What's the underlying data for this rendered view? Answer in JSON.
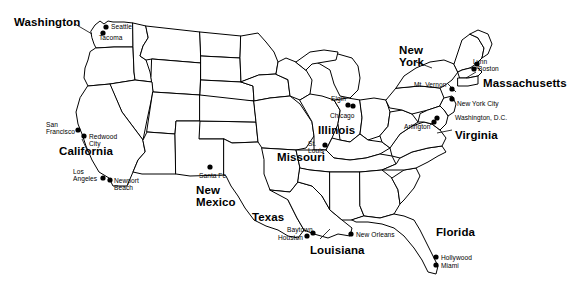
{
  "map": {
    "title": "United States map with selected states and cities",
    "stroke_color": "#000000",
    "fill_color": "#ffffff",
    "background": "#ffffff",
    "width": 581,
    "height": 296
  },
  "states": [
    {
      "name": "Washington",
      "label": "Washington",
      "x": 14,
      "y": 17,
      "lines": [
        "Washington"
      ]
    },
    {
      "name": "California",
      "label": "California",
      "x": 59,
      "y": 146,
      "lines": [
        "California"
      ]
    },
    {
      "name": "New Mexico",
      "label": "New Mexico",
      "x": 196,
      "y": 184,
      "lines": [
        "New",
        "Mexico"
      ]
    },
    {
      "name": "Texas",
      "label": "Texas",
      "x": 252,
      "y": 212,
      "lines": [
        "Texas"
      ]
    },
    {
      "name": "Louisiana",
      "label": "Louisiana",
      "x": 310,
      "y": 245,
      "lines": [
        "Louisiana"
      ]
    },
    {
      "name": "Missouri",
      "label": "Missouri",
      "x": 277,
      "y": 152,
      "lines": [
        "Missouri"
      ]
    },
    {
      "name": "Illinois",
      "label": "Illinois",
      "x": 318,
      "y": 125,
      "lines": [
        "Illinois"
      ]
    },
    {
      "name": "New York",
      "label": "New York",
      "x": 399,
      "y": 44,
      "lines": [
        "New",
        "York"
      ]
    },
    {
      "name": "Massachusetts",
      "label": "Massachusetts",
      "x": 483,
      "y": 78,
      "lines": [
        "Massachusetts"
      ]
    },
    {
      "name": "Virginia",
      "label": "Virginia",
      "x": 455,
      "y": 130,
      "lines": [
        "Virginia"
      ]
    },
    {
      "name": "Florida",
      "label": "Florida",
      "x": 436,
      "y": 227,
      "lines": [
        "Florida"
      ]
    }
  ],
  "cities": [
    {
      "name": "Seattle",
      "label": "Seattle",
      "dot_x": 106,
      "dot_y": 27,
      "label_x": 111,
      "label_y": 23,
      "align": "left",
      "lines": [
        "Seattle"
      ]
    },
    {
      "name": "Tacoma",
      "label": "Tacoma",
      "dot_x": 103,
      "dot_y": 33,
      "label_x": 99,
      "label_y": 34,
      "align": "left",
      "lines": [
        "Tacoma"
      ]
    },
    {
      "name": "San Francisco",
      "label": "San Francisco",
      "dot_x": 78,
      "dot_y": 130,
      "label_x": 46,
      "label_y": 121,
      "align": "left",
      "lines": [
        "San",
        "Francisco"
      ]
    },
    {
      "name": "Redwood City",
      "label": "Redwood City",
      "dot_x": 84,
      "dot_y": 136,
      "label_x": 89,
      "label_y": 133,
      "align": "left",
      "lines": [
        "Redwood",
        "City"
      ]
    },
    {
      "name": "Los Angeles",
      "label": "Los Angeles",
      "dot_x": 103,
      "dot_y": 178,
      "label_x": 73,
      "label_y": 168,
      "align": "left",
      "lines": [
        "Los",
        "Angeles"
      ]
    },
    {
      "name": "Newport Beach",
      "label": "Newport Beach",
      "dot_x": 110,
      "dot_y": 180,
      "label_x": 114,
      "label_y": 177,
      "align": "left",
      "lines": [
        "Newport",
        "Beach"
      ]
    },
    {
      "name": "Santa Fe",
      "label": "Santa Fe",
      "dot_x": 210,
      "dot_y": 167,
      "label_x": 199,
      "label_y": 172,
      "align": "left",
      "lines": [
        "Santa Fe"
      ]
    },
    {
      "name": "Baytown",
      "label": "Baytown",
      "dot_x": 313,
      "dot_y": 233,
      "label_x": 287,
      "label_y": 226,
      "align": "left",
      "lines": [
        "Baytown"
      ]
    },
    {
      "name": "Houston",
      "label": "Houston",
      "dot_x": 307,
      "dot_y": 236,
      "label_x": 278,
      "label_y": 234,
      "align": "left",
      "lines": [
        "Houston"
      ]
    },
    {
      "name": "New Orleans",
      "label": "New Orleans",
      "dot_x": 351,
      "dot_y": 234,
      "label_x": 356,
      "label_y": 231,
      "align": "left",
      "lines": [
        "New Orleans"
      ]
    },
    {
      "name": "Hollywood",
      "label": "Hollywood",
      "dot_x": 436,
      "dot_y": 257,
      "label_x": 441,
      "label_y": 254,
      "align": "left",
      "lines": [
        "Hollywood"
      ]
    },
    {
      "name": "Miami",
      "label": "Miami",
      "dot_x": 436,
      "dot_y": 265,
      "label_x": 441,
      "label_y": 262,
      "align": "left",
      "lines": [
        "Miami"
      ]
    },
    {
      "name": "St. Louis",
      "label": "St. Louis",
      "dot_x": 325,
      "dot_y": 145,
      "label_x": 308,
      "label_y": 140,
      "align": "left",
      "lines": [
        "St.",
        "Louis"
      ]
    },
    {
      "name": "Elgin",
      "label": "Elgin",
      "dot_x": 348,
      "dot_y": 105,
      "label_x": 331,
      "label_y": 95,
      "align": "left",
      "lines": [
        "Elgin"
      ]
    },
    {
      "name": "Chicago",
      "label": "Chicago",
      "dot_x": 353,
      "dot_y": 106,
      "label_x": 330,
      "label_y": 112,
      "align": "left",
      "lines": [
        "Chicago"
      ]
    },
    {
      "name": "Mt. Vernon",
      "label": "Mt. Vernon",
      "dot_x": 452,
      "dot_y": 89,
      "label_x": 414,
      "label_y": 81,
      "align": "left",
      "lines": [
        "Mt. Vernon"
      ]
    },
    {
      "name": "Lynn",
      "label": "Lynn",
      "dot_x": 477,
      "dot_y": 64,
      "label_x": 473,
      "label_y": 58,
      "align": "left",
      "lines": [
        "Lynn"
      ]
    },
    {
      "name": "Boston",
      "label": "Boston",
      "dot_x": 474,
      "dot_y": 69,
      "label_x": 478,
      "label_y": 65,
      "align": "left",
      "lines": [
        "Boston"
      ]
    },
    {
      "name": "New York City",
      "label": "New York City",
      "dot_x": 452,
      "dot_y": 99,
      "label_x": 457,
      "label_y": 100,
      "align": "left",
      "lines": [
        "New York City"
      ]
    },
    {
      "name": "Washington, D.C.",
      "label": "Washington, D.C.",
      "dot_x": 437,
      "dot_y": 118,
      "label_x": 455,
      "label_y": 114,
      "align": "left",
      "lines": [
        "Washington, D.C."
      ]
    },
    {
      "name": "Arlington",
      "label": "Arlington",
      "dot_x": 434,
      "dot_y": 122,
      "label_x": 404,
      "label_y": 123,
      "align": "left",
      "lines": [
        "Arlington"
      ]
    }
  ]
}
